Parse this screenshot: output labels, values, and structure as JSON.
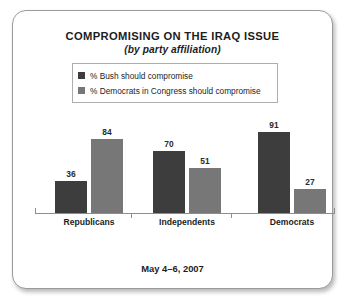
{
  "card": {
    "title": "COMPROMISING ON THE IRAQ ISSUE",
    "subtitle": "(by party affiliation)",
    "footer_note": "May 4–6, 2007"
  },
  "colors": {
    "series_1": "#3d3d3d",
    "series_2": "#777777",
    "axis": "#8d8d8d",
    "card_border": "#9b9b9b",
    "legend_border": "#adadad",
    "text": "#1d1d1d"
  },
  "legend": {
    "items": [
      {
        "label": "% Bush should compromise",
        "swatch": "#3d3d3d",
        "icon": "legend-swatch-icon"
      },
      {
        "label": "% Democrats in Congress should compromise",
        "swatch": "#777777",
        "icon": "legend-swatch-icon"
      }
    ]
  },
  "chart_data": {
    "type": "bar",
    "title": "COMPROMISING ON THE IRAQ ISSUE",
    "subtitle": "(by party affiliation)",
    "annotation": "May 4–6, 2007",
    "xlabel": "",
    "ylabel": "",
    "ylim": [
      0,
      100
    ],
    "grid": false,
    "legend_position": "top-center",
    "categories": [
      "Republicans",
      "Independents",
      "Democrats"
    ],
    "series": [
      {
        "name": "% Bush should compromise",
        "color": "#3d3d3d",
        "values": [
          36,
          70,
          91
        ]
      },
      {
        "name": "% Democrats in Congress should compromise",
        "color": "#777777",
        "values": [
          84,
          51,
          27
        ]
      }
    ]
  }
}
